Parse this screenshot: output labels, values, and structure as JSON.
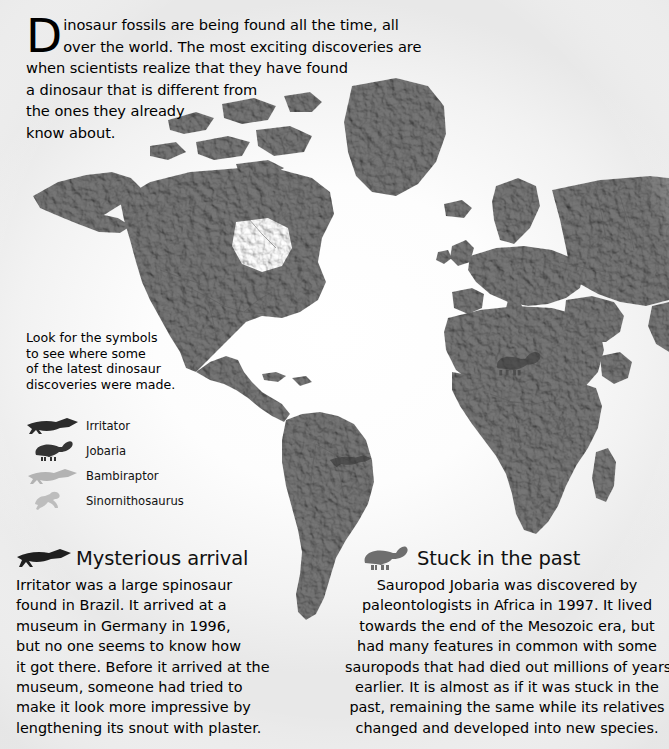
{
  "page": {
    "background_color": "#ffffff",
    "map_ink_color": "#6f6f6f"
  },
  "intro": {
    "dropcap": "D",
    "lines": [
      "inosaur fossils are being found all the time, all",
      "over the world. The most exciting discoveries are",
      "when scientists realize that they have found",
      "a dinosaur that is different from",
      "the ones they already",
      "know about."
    ],
    "full_text": "Dinosaur fossils are being found all the time, all over the world. The most exciting discoveries are when scientists realize that they have found a dinosaur that is different from the ones they already know about."
  },
  "legend_caption": {
    "lines": [
      "Look for the symbols",
      "to see where some",
      "of the latest dinosaur",
      "discoveries were made."
    ]
  },
  "legend": {
    "items": [
      {
        "label": "Irritator",
        "icon": "irritator-silhouette-icon",
        "tone": "dark"
      },
      {
        "label": "Jobaria",
        "icon": "jobaria-silhouette-icon",
        "tone": "dark"
      },
      {
        "label": "Bambiraptor",
        "icon": "bambiraptor-silhouette-icon",
        "tone": "light"
      },
      {
        "label": "Sinornithosaurus",
        "icon": "sinornithosaurus-silhouette-icon",
        "tone": "light"
      }
    ]
  },
  "map": {
    "type": "shaded-relief-world-map",
    "projection": "equirectangular",
    "markers": [
      {
        "species": "Jobaria",
        "region": "Africa - Sahara",
        "icon": "jobaria-silhouette-icon"
      },
      {
        "species": "Irritator",
        "region": "South America - Brazil",
        "icon": "irritator-silhouette-icon"
      }
    ]
  },
  "articles": [
    {
      "id": "mysterious-arrival",
      "heading": "Mysterious arrival",
      "icon": "irritator-silhouette-icon",
      "lines": [
        "Irritator was a large spinosaur",
        "found in Brazil. It arrived at a",
        "museum in Germany in 1996,",
        "but no one seems to know how",
        "it got there. Before it arrived at the",
        "museum, someone had tried to",
        "make it look more impressive by",
        "lengthening its snout with plaster."
      ],
      "full_text": "Irritator was a large spinosaur found in Brazil. It arrived at a museum in Germany in 1996, but no one seems to know how it got there. Before it arrived at the museum, someone had tried to make it look more impressive by lengthening its snout with plaster."
    },
    {
      "id": "stuck-in-the-past",
      "heading": "Stuck in the past",
      "icon": "jobaria-silhouette-icon",
      "lines": [
        "Sauropod Jobaria was discovered by",
        "paleontologists in Africa in 1997. It lived",
        "towards the end of the Mesozoic era, but",
        "had many features in common with some",
        "sauropods that had died out millions of years",
        "earlier. It is almost as if it was stuck in the",
        "past, remaining the same while its relatives",
        "changed and developed into new species."
      ],
      "full_text": "Sauropod Jobaria was discovered by paleontologists in Africa in 1997. It lived towards the end of the Mesozoic era, but had many features in common with some sauropods that had died out millions of years earlier. It is almost as if it was stuck in the past, remaining the same while its relatives changed and developed into new species."
    }
  ]
}
